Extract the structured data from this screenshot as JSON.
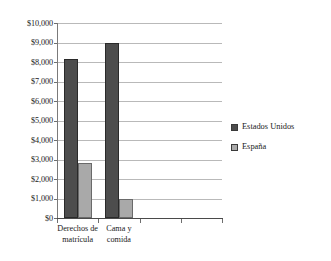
{
  "chart_data": {
    "type": "bar",
    "title": "",
    "subtitle": "",
    "xlabel": "",
    "ylabel": "",
    "categories": [
      "Derechos de matrícula",
      "Cama y comida",
      "",
      ""
    ],
    "category_lines": [
      [
        "Derechos de",
        "matrícula"
      ],
      [
        "Cama y",
        "comida"
      ],
      [
        ""
      ],
      [
        ""
      ]
    ],
    "series": [
      {
        "name": "Estados Unidos",
        "color": "#4d4d4d",
        "values": [
          8150,
          8950,
          null,
          null
        ]
      },
      {
        "name": "España",
        "color": "#a9a9a9",
        "values": [
          2800,
          950,
          null,
          null
        ]
      }
    ],
    "ylim": [
      0,
      10000
    ],
    "ytick_step": 1000,
    "ytick_labels": [
      "$10,000",
      "$9,000",
      "$8,000",
      "$7,000",
      "$6,000",
      "$5,000",
      "$4,000",
      "$3,000",
      "$2,000",
      "$1,000",
      "$0"
    ],
    "ytick_values": [
      10000,
      9000,
      8000,
      7000,
      6000,
      5000,
      4000,
      3000,
      2000,
      1000,
      0
    ],
    "grid": true,
    "grid_axis": "y",
    "legend_position": "right",
    "value_prefix": "$"
  },
  "legend": {
    "entries": [
      {
        "label": "Estados Unidos",
        "swatch": "legend-swatch-estados-unidos"
      },
      {
        "label": "España",
        "swatch": "legend-swatch-espana"
      }
    ]
  }
}
